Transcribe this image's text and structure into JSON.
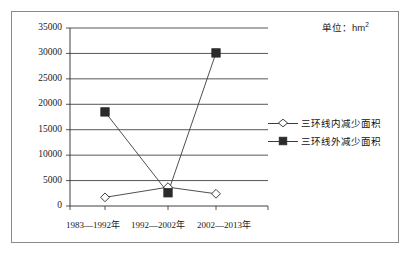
{
  "annotation": {
    "unit_label": "单位：hm",
    "unit_sup": "2"
  },
  "legend": {
    "position": "right",
    "items": [
      {
        "label": "三环线内减少面积",
        "marker": "hollow-diamond"
      },
      {
        "label": "三环线外减少面积",
        "marker": "filled-square"
      }
    ]
  },
  "axis": {
    "y_ticks": [
      "0",
      "5000",
      "10000",
      "15000",
      "20000",
      "25000",
      "30000",
      "35000"
    ],
    "x_ticks": [
      "1983—1992年",
      "1992—2002年",
      "2002—2013年"
    ]
  },
  "chart_data": {
    "type": "line",
    "title": "",
    "xlabel": "",
    "ylabel": "",
    "unit": "hm2",
    "categories": [
      "1983—1992年",
      "1992—2002年",
      "2002—2013年"
    ],
    "series": [
      {
        "name": "三环线内减少面积",
        "marker": "hollow-diamond",
        "values": [
          1700,
          3700,
          2400
        ]
      },
      {
        "name": "三环线外减少面积",
        "marker": "filled-square",
        "values": [
          18500,
          2600,
          30100
        ]
      }
    ],
    "ylim": [
      0,
      35000
    ],
    "ytick_step": 5000,
    "grid": true,
    "legend_position": "right"
  }
}
